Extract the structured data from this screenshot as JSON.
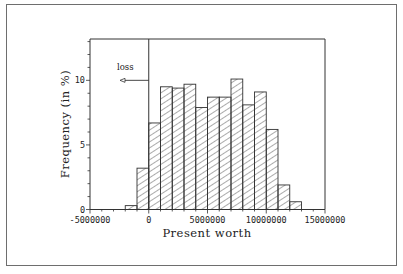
{
  "chart_data": {
    "type": "bar",
    "subtype": "histogram",
    "title": "",
    "xlabel": "Present worth",
    "ylabel": "Frequency (in %)",
    "xlim": [
      -5000000,
      15000000
    ],
    "ylim": [
      0,
      13.2
    ],
    "x_ticks": [
      -5000000,
      0,
      5000000,
      10000000,
      15000000
    ],
    "x_tick_labels": [
      "-5000000",
      "0",
      "5000000",
      "10000000",
      "15000000"
    ],
    "y_ticks": [
      0,
      5,
      10
    ],
    "y_tick_labels": [
      "0",
      "5",
      "10"
    ],
    "y_minor_tick_step": 1,
    "x_minor_tick_step": 1000000,
    "grid": false,
    "legend": null,
    "bin_width": 1000000,
    "bins": [
      {
        "start": -2000000,
        "end": -1000000,
        "value": 0.3
      },
      {
        "start": -1000000,
        "end": 0,
        "value": 3.2
      },
      {
        "start": 0,
        "end": 1000000,
        "value": 6.7
      },
      {
        "start": 1000000,
        "end": 2000000,
        "value": 9.5
      },
      {
        "start": 2000000,
        "end": 3000000,
        "value": 9.4
      },
      {
        "start": 3000000,
        "end": 4000000,
        "value": 9.7
      },
      {
        "start": 4000000,
        "end": 5000000,
        "value": 7.9
      },
      {
        "start": 5000000,
        "end": 6000000,
        "value": 8.7
      },
      {
        "start": 6000000,
        "end": 7000000,
        "value": 8.7
      },
      {
        "start": 7000000,
        "end": 8000000,
        "value": 10.1
      },
      {
        "start": 8000000,
        "end": 9000000,
        "value": 8.1
      },
      {
        "start": 9000000,
        "end": 10000000,
        "value": 9.1
      },
      {
        "start": 10000000,
        "end": 11000000,
        "value": 6.2
      },
      {
        "start": 11000000,
        "end": 12000000,
        "value": 1.9
      },
      {
        "start": 12000000,
        "end": 13000000,
        "value": 0.6
      }
    ],
    "categories": [
      "-2M..-1M",
      "-1M..0",
      "0..1M",
      "1M..2M",
      "2M..3M",
      "3M..4M",
      "4M..5M",
      "5M..6M",
      "6M..7M",
      "7M..8M",
      "8M..9M",
      "9M..10M",
      "10M..11M",
      "11M..12M",
      "12M..13M"
    ],
    "values": [
      0.3,
      3.2,
      6.7,
      9.5,
      9.4,
      9.7,
      7.9,
      8.7,
      8.7,
      10.1,
      8.1,
      9.1,
      6.2,
      1.9,
      0.6
    ],
    "bar_fill": "diagonal-hatch",
    "reference_line": {
      "x": 0,
      "style": "vertical solid line"
    },
    "annotations": [
      {
        "text": "loss",
        "arrow": "left-pointing arrow from x=0 line at y=10",
        "y": 10
      }
    ]
  },
  "colors": {
    "frame": "#6e6e6e",
    "axis": "#333333",
    "bar_edge": "#333333",
    "hatch": "#444444",
    "text": "#222222"
  }
}
